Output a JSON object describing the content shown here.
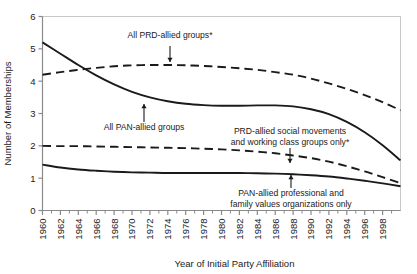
{
  "figure": {
    "background": "#ffffff",
    "line_color": "#1a1a1a"
  },
  "chart_data": {
    "type": "line",
    "title": "",
    "subtitle": "",
    "xlabel": "Year of Initial Party Affiliation",
    "ylabel": "Number of Memberships",
    "xlim": [
      1960,
      2000
    ],
    "ylim": [
      0,
      6
    ],
    "grid": false,
    "legend_position": "inline-annotations",
    "x_tick_labels": [
      "1960",
      "1962",
      "1964",
      "1966",
      "1968",
      "1970",
      "1972",
      "1974",
      "1976",
      "1978",
      "1980",
      "1982",
      "1984",
      "1986",
      "1988",
      "1990",
      "1992",
      "1994",
      "1996",
      "1998"
    ],
    "x_tick_values": [
      1960,
      1962,
      1964,
      1966,
      1968,
      1970,
      1972,
      1974,
      1976,
      1978,
      1980,
      1982,
      1984,
      1986,
      1988,
      1990,
      1992,
      1994,
      1996,
      1998
    ],
    "x_minor_ticks": [
      1961,
      1963,
      1965,
      1967,
      1969,
      1971,
      1973,
      1975,
      1977,
      1979,
      1981,
      1983,
      1985,
      1987,
      1989,
      1991,
      1993,
      1995,
      1997,
      1999
    ],
    "y_tick_labels": [
      "0",
      "1",
      "2",
      "3",
      "4",
      "5",
      "6"
    ],
    "y_tick_values": [
      0,
      1,
      2,
      3,
      4,
      5,
      6
    ],
    "x": [
      1960,
      1962,
      1964,
      1966,
      1968,
      1970,
      1972,
      1974,
      1976,
      1978,
      1980,
      1982,
      1984,
      1986,
      1988,
      1990,
      1992,
      1994,
      1996,
      1998,
      2000
    ],
    "series": [
      {
        "name": "All PAN-allied groups",
        "style": "solid",
        "values": [
          5.2,
          4.85,
          4.5,
          4.18,
          3.9,
          3.67,
          3.5,
          3.38,
          3.3,
          3.26,
          3.24,
          3.24,
          3.25,
          3.25,
          3.22,
          3.13,
          2.98,
          2.74,
          2.42,
          2.02,
          1.55
        ]
      },
      {
        "name": "All PRD-allied groups*",
        "style": "dashed",
        "values": [
          4.2,
          4.28,
          4.35,
          4.41,
          4.46,
          4.49,
          4.5,
          4.5,
          4.49,
          4.47,
          4.44,
          4.4,
          4.35,
          4.28,
          4.2,
          4.08,
          3.93,
          3.76,
          3.57,
          3.35,
          3.1
        ]
      },
      {
        "name": "PRD-allied social movements and working class groups only*",
        "style": "dashed",
        "values": [
          2.0,
          1.99,
          1.99,
          1.98,
          1.97,
          1.96,
          1.95,
          1.94,
          1.93,
          1.91,
          1.89,
          1.86,
          1.82,
          1.77,
          1.7,
          1.62,
          1.51,
          1.37,
          1.21,
          1.03,
          0.85
        ]
      },
      {
        "name": "PAN-allied professional and family values organizations only",
        "style": "solid",
        "values": [
          1.42,
          1.33,
          1.27,
          1.23,
          1.2,
          1.18,
          1.17,
          1.16,
          1.16,
          1.16,
          1.16,
          1.16,
          1.15,
          1.14,
          1.12,
          1.09,
          1.05,
          0.99,
          0.92,
          0.84,
          0.75
        ]
      }
    ],
    "annotations": [
      {
        "id": "ann-prd-all",
        "lines": [
          "All PRD-allied groups*"
        ],
        "text_x": 170,
        "text_y": 38,
        "anchor": "middle",
        "arrow_from_y": 46,
        "arrow_to_y": 62,
        "arrow_x": 170,
        "arrow_dir": "down"
      },
      {
        "id": "ann-pan-all",
        "lines": [
          "All PAN-allied groups"
        ],
        "text_x": 144,
        "text_y": 130,
        "anchor": "middle",
        "arrow_from_y": 122,
        "arrow_to_y": 104,
        "arrow_x": 144,
        "arrow_dir": "up"
      },
      {
        "id": "ann-prd-social",
        "lines": [
          "PRD-allied social movements",
          "and working class groups only*"
        ],
        "text_x": 290,
        "text_y": 134,
        "anchor": "middle",
        "arrow_from_y": 148,
        "arrow_to_y": 163,
        "arrow_x": 290,
        "arrow_dir": "down"
      },
      {
        "id": "ann-pan-prof",
        "lines": [
          "PAN-allied professional and",
          "family values organizations only"
        ],
        "text_x": 291,
        "text_y": 196,
        "anchor": "middle",
        "arrow_from_y": 188,
        "arrow_to_y": 175,
        "arrow_x": 291,
        "arrow_dir": "up"
      }
    ]
  }
}
